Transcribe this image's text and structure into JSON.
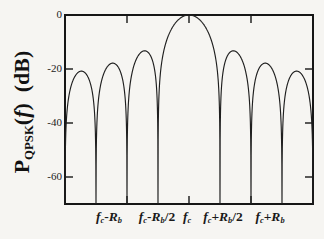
{
  "figure": {
    "background": "#f6f5f2",
    "line_color": "#1f1f1f",
    "frame_color": "#161616"
  },
  "chart_data": {
    "type": "line",
    "title": "",
    "ylabel_text": "P_QPSK(f) (dB)",
    "ylabel_parts": [
      {
        "t": "P"
      },
      {
        "t": "QPSK",
        "sub": true
      },
      {
        "t": "("
      },
      {
        "t": "f",
        "it": true
      },
      {
        "t": ")"
      },
      {
        "t": " (dB)"
      }
    ],
    "ylim": [
      -70,
      0
    ],
    "y_ticks": [
      {
        "db": 0,
        "label": "0"
      },
      {
        "db": -20,
        "label": "-20"
      },
      {
        "db": -40,
        "label": "-40"
      },
      {
        "db": -60,
        "label": "-60"
      }
    ],
    "x_unit": "v = (f - fc) / (Rb/2)",
    "xlim": [
      -4,
      4
    ],
    "x_ticks_v": [
      -2,
      0,
      2
    ],
    "x_labels": [
      {
        "text": "fc-Rb",
        "x_px": 109,
        "parts": [
          {
            "t": "f",
            "it": true
          },
          {
            "t": "c",
            "sub": true,
            "it": true
          },
          {
            "t": "-",
            "up": true
          },
          {
            "t": "R",
            "it": true
          },
          {
            "t": "b",
            "sub": true,
            "it": true
          }
        ]
      },
      {
        "text": "fc-Rb/2",
        "x_px": 157,
        "parts": [
          {
            "t": "f",
            "it": true
          },
          {
            "t": "c",
            "sub": true,
            "it": true
          },
          {
            "t": "-",
            "up": true
          },
          {
            "t": "R",
            "it": true
          },
          {
            "t": "b",
            "sub": true,
            "it": true
          },
          {
            "t": "/2",
            "up": true
          }
        ]
      },
      {
        "text": "fc",
        "x_px": 187,
        "parts": [
          {
            "t": "f",
            "it": true
          },
          {
            "t": "c",
            "sub": true,
            "it": true
          }
        ]
      },
      {
        "text": "fc+Rb/2",
        "x_px": 223,
        "parts": [
          {
            "t": "f",
            "it": true
          },
          {
            "t": "c",
            "sub": true,
            "it": true
          },
          {
            "t": "+",
            "up": true
          },
          {
            "t": "R",
            "it": true
          },
          {
            "t": "b",
            "sub": true,
            "it": true
          },
          {
            "t": "/2",
            "up": true
          }
        ]
      },
      {
        "text": "fc+Rb",
        "x_px": 270,
        "parts": [
          {
            "t": "f",
            "it": true
          },
          {
            "t": "c",
            "sub": true,
            "it": true
          },
          {
            "t": "+",
            "up": true
          },
          {
            "t": "R",
            "it": true
          },
          {
            "t": "b",
            "sub": true,
            "it": true
          }
        ]
      }
    ],
    "curve": {
      "formula": "PdB(v) = 20*log10(|sin(pi*v)/(pi*v)|)",
      "clip_db": -70,
      "nulls_v": [
        -4,
        -3,
        -2,
        -1,
        1,
        2,
        3,
        4
      ],
      "main_peak": {
        "v": 0,
        "db": 0
      },
      "sidelobe_peaks_db": [
        -13.3,
        -17.9,
        -20.8
      ]
    },
    "plot_box_px": {
      "left": 65,
      "top": 15,
      "right": 313,
      "bottom": 204
    },
    "grid": "off",
    "legend": "none",
    "tick_len_px": 7
  }
}
